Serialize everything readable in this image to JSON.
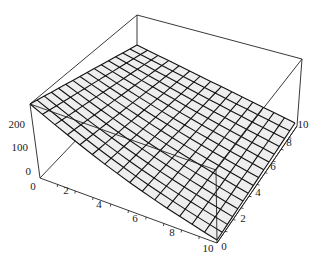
{
  "chart_data": {
    "type": "surface3d",
    "title": "",
    "xlabel": "",
    "ylabel": "",
    "zlabel": "",
    "x_range": [
      0,
      10
    ],
    "y_range": [
      0,
      10
    ],
    "z_range": [
      0,
      280
    ],
    "x_ticks": [
      "0",
      "2",
      "4",
      "6",
      "8",
      "10"
    ],
    "y_ticks": [
      "0",
      "2",
      "4",
      "6",
      "8",
      "10"
    ],
    "z_ticks": [
      "0",
      "100",
      "200"
    ],
    "mesh_cells": 15,
    "surface_color": "#eeeeee",
    "mesh_color": "#111111",
    "corner_values": [
      {
        "x": 0,
        "y": 0,
        "z": 280
      },
      {
        "x": 10,
        "y": 0,
        "z": 5
      },
      {
        "x": 0,
        "y": 10,
        "z": 170
      },
      {
        "x": 10,
        "y": 10,
        "z": 15
      }
    ],
    "boxed": true,
    "grid": false,
    "legend": null
  },
  "axes": {
    "x_labels": [
      {
        "text": "0",
        "x": 33,
        "y": 190
      },
      {
        "text": "2",
        "x": 66,
        "y": 194
      },
      {
        "text": "4",
        "x": 99,
        "y": 208
      },
      {
        "text": "6",
        "x": 135,
        "y": 222
      },
      {
        "text": "8",
        "x": 172,
        "y": 236
      },
      {
        "text": "10",
        "x": 208,
        "y": 252
      }
    ],
    "y_labels": [
      {
        "text": "0",
        "x": 224,
        "y": 250
      },
      {
        "text": "2",
        "x": 243,
        "y": 222
      },
      {
        "text": "4",
        "x": 258,
        "y": 196
      },
      {
        "text": "6",
        "x": 273,
        "y": 170
      },
      {
        "text": "8",
        "x": 289,
        "y": 146
      },
      {
        "text": "10",
        "x": 303,
        "y": 128
      }
    ],
    "z_labels": [
      {
        "text": "200",
        "x": 25,
        "y": 128
      },
      {
        "text": "100",
        "x": 28,
        "y": 151
      },
      {
        "text": "0",
        "x": 31,
        "y": 175
      }
    ]
  }
}
